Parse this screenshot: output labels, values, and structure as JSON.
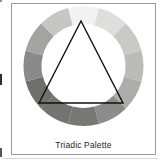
{
  "figure": {
    "caption": "Triadic Palette",
    "caption_icon": "caption-label",
    "frame_color": "#9a9a9a",
    "background": "#ffffff"
  },
  "color_wheel": {
    "name": "color-wheel",
    "type": "ring",
    "center": {
      "x": 71.5,
      "y": 62
    },
    "outer_radius": 60,
    "inner_radius": 42,
    "segment_count": 12,
    "segments": [
      {
        "index": 0,
        "start_angle": -105,
        "end_angle": -75,
        "position": "top",
        "color": "#f2f2f0"
      },
      {
        "index": 1,
        "start_angle": -75,
        "end_angle": -45,
        "position": "top-right",
        "color": "#dededc"
      },
      {
        "index": 2,
        "start_angle": -45,
        "end_angle": -15,
        "position": "upper-right",
        "color": "#c9c9c6"
      },
      {
        "index": 3,
        "start_angle": -15,
        "end_angle": 15,
        "position": "right",
        "color": "#bbbbb8"
      },
      {
        "index": 4,
        "start_angle": 15,
        "end_angle": 45,
        "position": "lower-right",
        "color": "#adadaa"
      },
      {
        "index": 5,
        "start_angle": 45,
        "end_angle": 75,
        "position": "bottom-right",
        "color": "#8c8c8a"
      },
      {
        "index": 6,
        "start_angle": 75,
        "end_angle": 105,
        "position": "bottom",
        "color": "#777775"
      },
      {
        "index": 7,
        "start_angle": 105,
        "end_angle": 135,
        "position": "bottom-left",
        "color": "#737371"
      },
      {
        "index": 8,
        "start_angle": 135,
        "end_angle": 165,
        "position": "lower-left",
        "color": "#6f6f6d"
      },
      {
        "index": 9,
        "start_angle": 165,
        "end_angle": 195,
        "position": "left",
        "color": "#8a8a88"
      },
      {
        "index": 10,
        "start_angle": 195,
        "end_angle": 225,
        "position": "upper-left",
        "color": "#a3a3a0"
      },
      {
        "index": 11,
        "start_angle": 225,
        "end_angle": 255,
        "position": "top-left",
        "color": "#c6c6c3"
      }
    ]
  },
  "triad_triangle": {
    "name": "triad-triangle",
    "stroke_color": "#101010",
    "stroke_width": 1.4,
    "fill": "none",
    "vertices": [
      {
        "label": "apex",
        "x": 69,
        "y": 17
      },
      {
        "label": "bottom-left",
        "x": 27,
        "y": 99
      },
      {
        "label": "bottom-right",
        "x": 111,
        "y": 99
      }
    ]
  }
}
